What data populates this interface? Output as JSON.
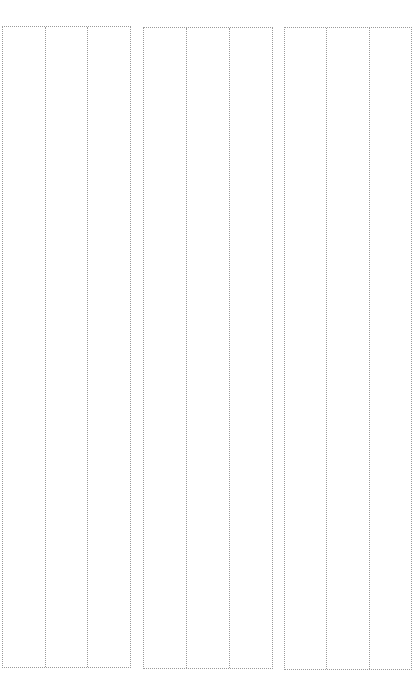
{
  "page": {
    "background": "#ffffff",
    "line_color": "#9a9a9a",
    "line_style": "dotted"
  },
  "panels": [
    {
      "id": "panel-1",
      "columns": 3
    },
    {
      "id": "panel-2",
      "columns": 3
    },
    {
      "id": "panel-3",
      "columns": 3
    }
  ]
}
